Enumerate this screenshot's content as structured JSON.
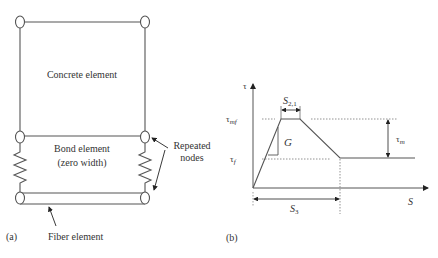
{
  "panel_a": {
    "caption": "(a)",
    "concrete_label": "Concrete element",
    "bond_label_line1": "Bond element",
    "bond_label_line2": "(zero width)",
    "repeated_label_line1": "Repeated",
    "repeated_label_line2": "nodes",
    "fiber_label": "Fiber element"
  },
  "panel_b": {
    "caption": "(b)",
    "y_axis_label": "τ",
    "x_axis_label": "S",
    "tau_mf_main": "τ",
    "tau_mf_sub": "mf",
    "tau_f_main": "τ",
    "tau_f_sub": "f",
    "tau_m_main": "τ",
    "tau_m_sub": "m",
    "g_label": "G",
    "s21_main": "S",
    "s21_sub": "2,1",
    "s3_main": "S",
    "s3_sub": "3"
  },
  "colors": {
    "line": "#555555",
    "text": "#333333",
    "dotted": "#777777"
  }
}
